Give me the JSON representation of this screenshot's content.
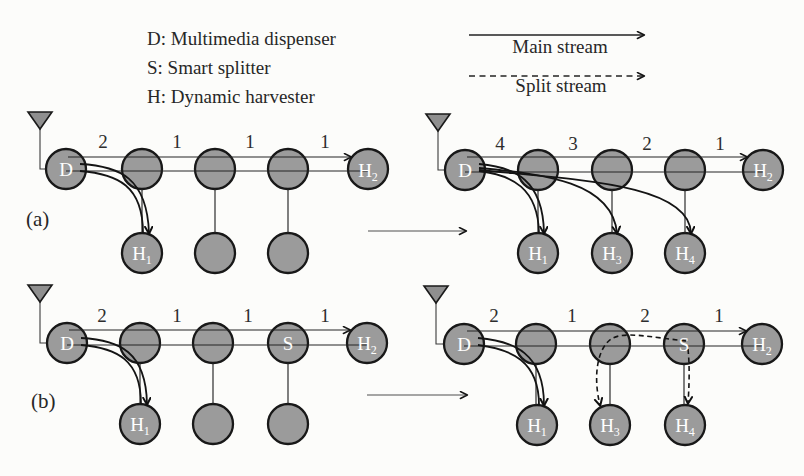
{
  "figure": {
    "key": {
      "items": [
        "D: Multimedia dispenser",
        "S: Smart splitter",
        "H: Dynamic harvester"
      ]
    },
    "streams": {
      "main": "Main stream",
      "split": "Split stream"
    },
    "captions": {
      "a": "(a)",
      "b": "(b)"
    }
  },
  "colors": {
    "background": "#fcfcfa",
    "node_fill": "#9b9b9b",
    "node_stroke": "#181818",
    "line": "#242424",
    "node_label": "#ffffff"
  },
  "panels": [
    {
      "id": "a-initial",
      "weights": [
        "2",
        "1",
        "1",
        "1"
      ],
      "top": [
        {
          "main": "D"
        },
        {},
        {},
        {},
        {
          "main": "H",
          "sub": "2"
        }
      ],
      "bottom": [
        {
          "main": "H",
          "sub": "1"
        },
        {},
        {}
      ]
    },
    {
      "id": "a-final",
      "weights": [
        "4",
        "3",
        "2",
        "1"
      ],
      "top": [
        {
          "main": "D"
        },
        {},
        {},
        {},
        {
          "main": "H",
          "sub": "2"
        }
      ],
      "bottom": [
        {
          "main": "H",
          "sub": "1"
        },
        {
          "main": "H",
          "sub": "3"
        },
        {
          "main": "H",
          "sub": "4"
        }
      ]
    },
    {
      "id": "b-initial",
      "weights": [
        "2",
        "1",
        "1",
        "1"
      ],
      "top": [
        {
          "main": "D"
        },
        {},
        {},
        {
          "main": "S"
        },
        {
          "main": "H",
          "sub": "2"
        }
      ],
      "bottom": [
        {
          "main": "H",
          "sub": "1"
        },
        {},
        {}
      ]
    },
    {
      "id": "b-final",
      "weights": [
        "2",
        "1",
        "2",
        "1"
      ],
      "top": [
        {
          "main": "D"
        },
        {},
        {},
        {
          "main": "S"
        },
        {
          "main": "H",
          "sub": "2"
        }
      ],
      "bottom": [
        {
          "main": "H",
          "sub": "1"
        },
        {
          "main": "H",
          "sub": "3"
        },
        {
          "main": "H",
          "sub": "4"
        }
      ]
    }
  ]
}
